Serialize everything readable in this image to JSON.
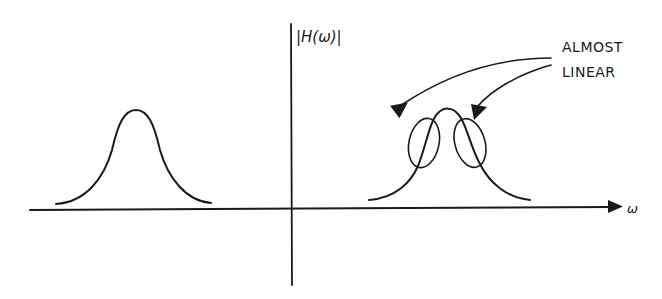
{
  "figure": {
    "y_axis_label": "|H(ω)|",
    "x_axis_label": "ω",
    "annotation": {
      "line1": "ALMOST",
      "line2": "LINEAR"
    }
  },
  "colors": {
    "ink": "#1a1a1a",
    "background": "#ffffff"
  }
}
